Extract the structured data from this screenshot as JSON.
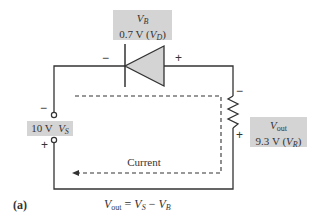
{
  "diode_label": {
    "symbol": "V",
    "symbol_sub": "B",
    "value": "0.7 V (",
    "value_var": "V",
    "value_sub": "D",
    "value_close": ")"
  },
  "diode_polarity": {
    "left": "−",
    "right": "+"
  },
  "resistor_label": {
    "symbol": "V",
    "symbol_sub": "out",
    "value": "9.3 V (",
    "value_var": "V",
    "value_sub": "R",
    "value_close": ")"
  },
  "resistor_polarity": {
    "top": "−",
    "bottom": "+"
  },
  "source_label": {
    "value": "10 V",
    "symbol": "V",
    "symbol_sub": "S"
  },
  "source_polarity": {
    "top": "−",
    "bottom": "+"
  },
  "current_label": "Current",
  "figure_label": "(a)",
  "equation": {
    "lhs": "V",
    "lhs_sub": "out",
    "eq": " = ",
    "t1": "V",
    "t1_sub": "S",
    "minus": " − ",
    "t2": "V",
    "t2_sub": "B"
  },
  "colors": {
    "wire": "#333333",
    "diode_fill": "#d4d4d4",
    "label_box": "#d4d4d4"
  }
}
